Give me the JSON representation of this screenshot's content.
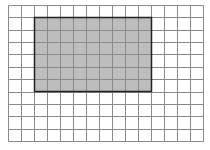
{
  "diagram": {
    "type": "grid-with-shaded-rectangle",
    "grid": {
      "columns": 15,
      "rows": 11,
      "cell_width": 13,
      "cell_height": 12.36,
      "line_color": "#8a8a8a",
      "background": "#ffffff"
    },
    "shaded_rectangle": {
      "col_start": 2,
      "row_start": 1,
      "col_span": 9,
      "row_span": 6,
      "fill": "#bdbdbd",
      "border": "#222222"
    }
  }
}
